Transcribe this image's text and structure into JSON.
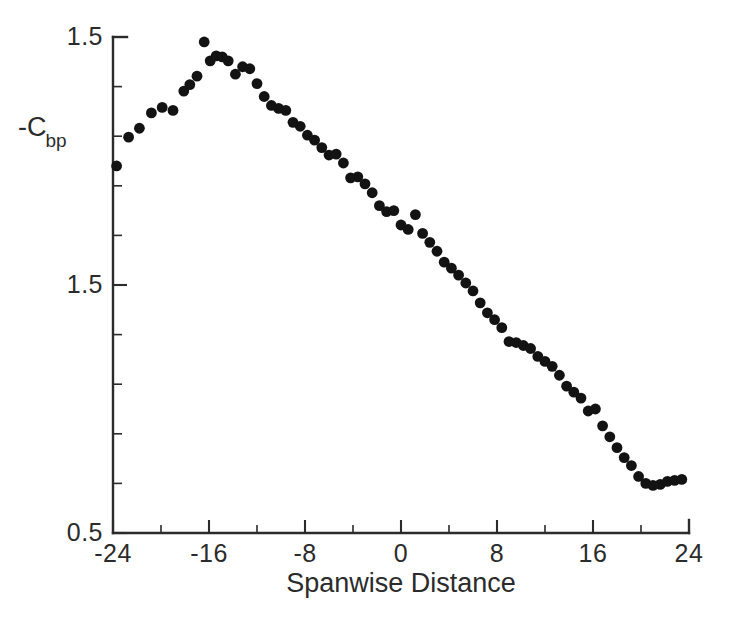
{
  "chart_data": {
    "type": "scatter",
    "title": "",
    "subtitle": "",
    "xlabel": "Spanwise Distance",
    "ylabel": "-C",
    "ylabel_subscript": "bp",
    "ylabel_full": "-Cbp",
    "xlim": [
      -24,
      24
    ],
    "ylim": [
      0.5,
      1.5
    ],
    "grid": false,
    "legend": null,
    "legend_position": "none",
    "marker": "filled-circle",
    "marker_color": "#131313",
    "background_color": "#ffffff",
    "axis_color": "#2b2b2b",
    "x_major_ticks": [
      -24,
      -16,
      -8,
      0,
      8,
      16,
      24
    ],
    "x_major_tick_labels": [
      "-24",
      "-16",
      "-8",
      "0",
      "8",
      "16",
      "24"
    ],
    "x_minor_tick_interval": 4,
    "y_major_ticks": [
      0.5,
      1.0,
      1.5
    ],
    "y_major_tick_labels": [
      "0.5",
      "1.5",
      "1.5"
    ],
    "y_minor_tick_interval": 0.1,
    "series": [
      {
        "name": "Cbp",
        "x": [
          -23.7,
          -22.7,
          -21.8,
          -20.8,
          -19.9,
          -19.0,
          -18.1,
          -17.6,
          -17.0,
          -16.4,
          -15.9,
          -15.4,
          -14.9,
          -14.4,
          -13.8,
          -13.2,
          -12.6,
          -12.0,
          -11.4,
          -10.8,
          -10.2,
          -9.6,
          -9.0,
          -8.4,
          -7.8,
          -7.2,
          -6.6,
          -6.0,
          -5.4,
          -4.8,
          -4.2,
          -3.6,
          -3.0,
          -2.4,
          -1.8,
          -1.2,
          -0.6,
          0.0,
          0.6,
          1.2,
          1.8,
          2.4,
          3.0,
          3.6,
          4.2,
          4.8,
          5.4,
          6.0,
          6.6,
          7.2,
          7.8,
          8.4,
          9.0,
          9.6,
          10.2,
          10.8,
          11.4,
          12.0,
          12.6,
          13.2,
          13.8,
          14.4,
          15.0,
          15.6,
          16.2,
          16.8,
          17.4,
          18.0,
          18.6,
          19.2,
          19.8,
          20.4,
          21.0,
          21.6,
          22.2,
          22.8,
          23.4
        ],
        "y": [
          1.24,
          1.298,
          1.316,
          1.347,
          1.358,
          1.352,
          1.391,
          1.404,
          1.421,
          1.49,
          1.452,
          1.462,
          1.46,
          1.452,
          1.425,
          1.44,
          1.436,
          1.406,
          1.38,
          1.362,
          1.356,
          1.352,
          1.328,
          1.32,
          1.302,
          1.292,
          1.277,
          1.262,
          1.264,
          1.246,
          1.216,
          1.218,
          1.204,
          1.186,
          1.16,
          1.148,
          1.15,
          1.121,
          1.112,
          1.142,
          1.104,
          1.086,
          1.068,
          1.046,
          1.034,
          1.02,
          1.004,
          0.988,
          0.964,
          0.944,
          0.93,
          0.914,
          0.886,
          0.884,
          0.878,
          0.872,
          0.856,
          0.846,
          0.836,
          0.818,
          0.796,
          0.784,
          0.772,
          0.746,
          0.75,
          0.716,
          0.694,
          0.672,
          0.652,
          0.636,
          0.614,
          0.6,
          0.596,
          0.598,
          0.604,
          0.606,
          0.608
        ]
      }
    ]
  },
  "axes": {
    "y_title_main": "-C",
    "y_title_sub": "bp",
    "x_title": "Spanwise Distance"
  }
}
